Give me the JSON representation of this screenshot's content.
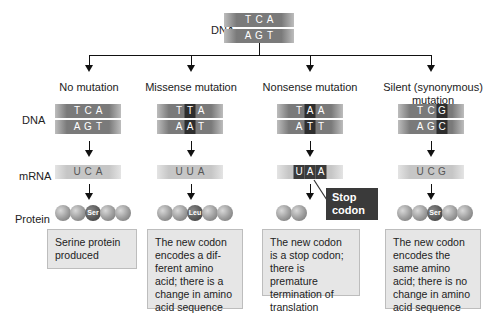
{
  "top": {
    "label": "DNA",
    "template_strand": [
      "T",
      "C",
      "A"
    ],
    "coding_strand": [
      "A",
      "G",
      "T"
    ]
  },
  "row_labels": {
    "dna": "DNA",
    "mrna": "mRNA",
    "protein": "Protein"
  },
  "columns": [
    {
      "title": "No mutation",
      "dna_top": [
        "T",
        "C",
        "A"
      ],
      "dna_top_hl": [],
      "dna_bottom": [
        "A",
        "G",
        "T"
      ],
      "dna_bottom_hl": [],
      "mrna": [
        "U",
        "C",
        "A"
      ],
      "mrna_hl": [],
      "protein_beads": 5,
      "amino_label": "Ser",
      "amino_index": 2,
      "description": "Serine protein produced"
    },
    {
      "title": "Missense mutation",
      "dna_top": [
        "T",
        "T",
        "A"
      ],
      "dna_top_hl": [
        1
      ],
      "dna_bottom": [
        "A",
        "A",
        "T"
      ],
      "dna_bottom_hl": [
        1
      ],
      "mrna": [
        "U",
        "U",
        "A"
      ],
      "mrna_hl": [],
      "protein_beads": 5,
      "amino_label": "Leu",
      "amino_index": 2,
      "description": "The new codon encodes a dif-ferent amino acid; there is a change in amino acid sequence"
    },
    {
      "title": "Nonsense mutation",
      "dna_top": [
        "T",
        "A",
        "A"
      ],
      "dna_top_hl": [
        1
      ],
      "dna_bottom": [
        "A",
        "T",
        "T"
      ],
      "dna_bottom_hl": [
        1
      ],
      "mrna": [
        "U",
        "A",
        "A"
      ],
      "mrna_hl": [
        0,
        1,
        2
      ],
      "protein_beads": 2,
      "amino_label": "",
      "amino_index": -1,
      "stop_label": "Stop codon",
      "description": "The new codon is a stop codon; there is premature termination of translation"
    },
    {
      "title": "Silent (synonymous) mutation",
      "dna_top": [
        "T",
        "C",
        "G"
      ],
      "dna_top_hl": [
        2
      ],
      "dna_bottom": [
        "A",
        "G",
        "C"
      ],
      "dna_bottom_hl": [
        2
      ],
      "mrna": [
        "U",
        "C",
        "G"
      ],
      "mrna_hl": [],
      "protein_beads": 5,
      "amino_label": "Ser",
      "amino_index": 2,
      "description": "The new codon encodes the same amino acid; there is no change in amino acid sequence"
    }
  ]
}
